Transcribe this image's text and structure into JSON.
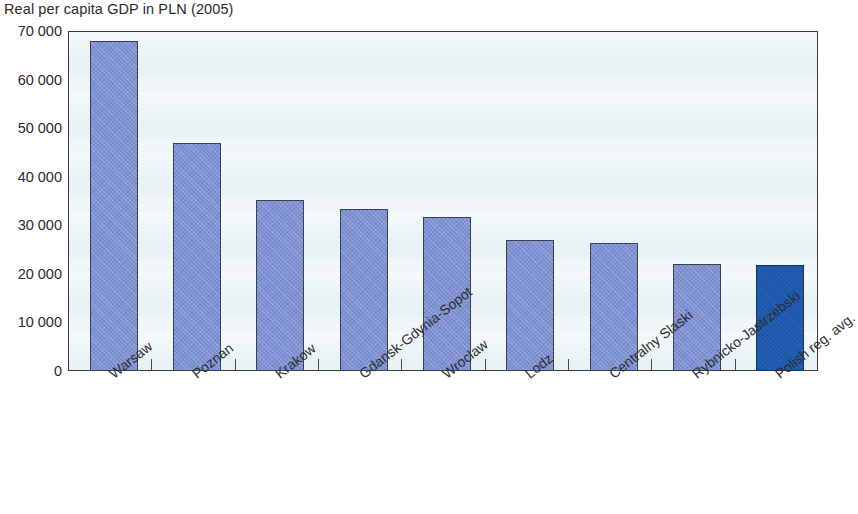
{
  "chart_data": {
    "type": "bar",
    "title": "Real per capita GDP in PLN (2005)",
    "xlabel": "",
    "ylabel": "",
    "categories": [
      "Warsaw",
      "Poznan",
      "Krakow",
      "Gdansk-Gdynia-Sopot",
      "Wroclaw",
      "Lodz",
      "Centralny Slaski",
      "Rybnicko-Jastrzebski",
      "Polish reg. avg."
    ],
    "values": [
      68000,
      47000,
      35300,
      33300,
      31800,
      27000,
      26400,
      22000,
      21800
    ],
    "ylim": [
      0,
      70000
    ],
    "ytick_values": [
      0,
      10000,
      20000,
      30000,
      40000,
      50000,
      60000,
      70000
    ],
    "ytick_labels": [
      "0",
      "10 000",
      "20 000",
      "30 000",
      "40 000",
      "50 000",
      "60 000",
      "70 000"
    ],
    "grid": false,
    "legend": null,
    "highlight_index": 8,
    "colors": {
      "bar": "#7d91d3",
      "bar_border": "#3b3f52",
      "highlight_bar": "#1d56ad",
      "highlight_border": "#16325f",
      "plot_background": "#e9f3f5",
      "plot_border": "#3a3a3a",
      "text": "#2b2b2b",
      "page_background": "#ffffff"
    }
  }
}
